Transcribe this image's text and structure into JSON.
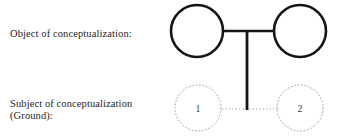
{
  "figure": {
    "width": 337,
    "height": 137,
    "background_color": "#ffffff"
  },
  "labels": {
    "object_row": "Object of conceptualization:",
    "subject_row_line1": "Subject of conceptualization",
    "subject_row_line2": "(Ground):"
  },
  "diagram": {
    "object_nodes": [
      {
        "id": "object-left",
        "label": "",
        "cx": 197,
        "cy": 31,
        "r": 26,
        "stroke": "#151515",
        "stroke_width": 2.6,
        "style": "solid"
      },
      {
        "id": "object-right",
        "label": "",
        "cx": 300,
        "cy": 31,
        "r": 26,
        "stroke": "#151515",
        "stroke_width": 2.6,
        "style": "solid"
      }
    ],
    "ground_nodes": [
      {
        "id": "ground-1",
        "label": "1",
        "cx": 198,
        "cy": 108,
        "r": 23,
        "stroke": "#8c8c8c",
        "stroke_width": 0.9,
        "style": "dotted"
      },
      {
        "id": "ground-2",
        "label": "2",
        "cx": 300,
        "cy": 108,
        "r": 23,
        "stroke": "#8c8c8c",
        "stroke_width": 0.9,
        "style": "dotted"
      }
    ],
    "connectors": [
      {
        "id": "object-horizontal-link",
        "type": "horizontal",
        "x1": 223,
        "y1": 31,
        "x2": 274,
        "y2": 31,
        "stroke": "#151515",
        "stroke_width": 2.6,
        "style": "solid"
      },
      {
        "id": "ground-vertical-link",
        "type": "vertical",
        "x1": 247,
        "y1": 31,
        "x2": 247,
        "y2": 110,
        "stroke": "#151515",
        "stroke_width": 2.8,
        "style": "solid"
      },
      {
        "id": "ground-horizontal-link",
        "type": "horizontal",
        "x1": 222,
        "y1": 109,
        "x2": 278,
        "y2": 109,
        "stroke": "#9a9a9a",
        "stroke_width": 0.9,
        "style": "dotted"
      }
    ]
  }
}
